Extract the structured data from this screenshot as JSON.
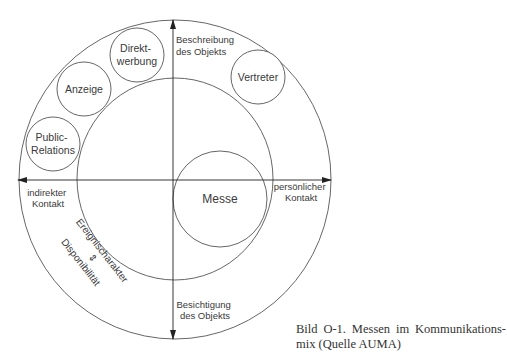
{
  "diagram": {
    "center_label": "Messe",
    "ring_items": [
      {
        "line1": "Direkt-",
        "line2": "werbung"
      },
      {
        "line1": "Anzeige",
        "line2": ""
      },
      {
        "line1": "Public-",
        "line2": "Relations"
      },
      {
        "line1": "Vertreter",
        "line2": ""
      }
    ],
    "axes": {
      "top": {
        "line1": "Beschreibung",
        "line2": "des Objekts"
      },
      "bottom": {
        "line1": "Besichtigung",
        "line2": "des Objekts"
      },
      "left": {
        "line1": "indirekter",
        "line2": "Kontakt"
      },
      "right": {
        "line1": "persönlicher",
        "line2": "Kontakt"
      }
    },
    "diagonal": {
      "line1": "Ereignischarakter",
      "symbol": "⇕",
      "line2": "Disponibilität"
    },
    "colors": {
      "stroke": "#555555",
      "text": "#3a3a3a"
    }
  },
  "caption": {
    "line1": "Bild O-1. Messen im Kommunikations-",
    "line2": "mix (Quelle AUMA)"
  }
}
